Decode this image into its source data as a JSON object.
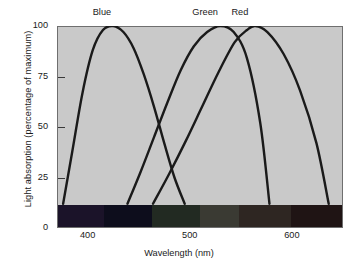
{
  "chart_data": {
    "type": "line",
    "title": "",
    "xlabel": "Wavelength (nm)",
    "ylabel": "Light absorption (percentage of maximum)",
    "xlim": [
      370,
      650
    ],
    "ylim": [
      0,
      100
    ],
    "grid": false,
    "legend_position": "inline-top-annotations",
    "x_ticks": [
      400,
      500,
      600
    ],
    "x_tick_labels": [
      "400",
      "500",
      "600"
    ],
    "y_ticks": [
      0,
      25,
      50,
      75,
      100
    ],
    "y_tick_labels": [
      "0",
      "25",
      "50",
      "75",
      "100"
    ],
    "annotations": [
      {
        "text": "Blue",
        "x": 414,
        "y": 100
      },
      {
        "text": "Green",
        "x": 515,
        "y": 100
      },
      {
        "text": "Red",
        "x": 549,
        "y": 100
      }
    ],
    "series": [
      {
        "name": "Blue",
        "color": "#1a1a1a",
        "peak_x": 425,
        "peak_y": 100,
        "x": [
          376,
          385,
          395,
          405,
          415,
          425,
          435,
          445,
          455,
          465,
          475,
          485,
          495
        ],
        "y": [
          12,
          38,
          67,
          88,
          98,
          100,
          97,
          89,
          76,
          60,
          42,
          25,
          12
        ]
      },
      {
        "name": "Green",
        "color": "#1a1a1a",
        "peak_x": 530,
        "peak_y": 100,
        "x": [
          439,
          452,
          465,
          478,
          491,
          504,
          517,
          530,
          543,
          556,
          569,
          578
        ],
        "y": [
          12,
          28,
          45,
          62,
          78,
          90,
          97,
          100,
          97,
          84,
          52,
          12
        ]
      },
      {
        "name": "Red",
        "color": "#1a1a1a",
        "peak_x": 564,
        "peak_y": 100,
        "x": [
          464,
          480,
          496,
          512,
          528,
          544,
          556,
          564,
          576,
          592,
          608,
          624,
          636
        ],
        "y": [
          12,
          27,
          43,
          60,
          77,
          92,
          98,
          100,
          97,
          86,
          68,
          42,
          12
        ]
      }
    ],
    "spectrum_band": {
      "description": "visible-light spectrum strip along the x-axis baseline",
      "segments": [
        {
          "name": "violet",
          "color": "#1b1329",
          "start_x": 370,
          "end_x": 415
        },
        {
          "name": "blue",
          "color": "#0d0d1c",
          "start_x": 415,
          "end_x": 463
        },
        {
          "name": "green",
          "color": "#222a22",
          "start_x": 463,
          "end_x": 510
        },
        {
          "name": "yellow",
          "color": "#3a3a33",
          "start_x": 510,
          "end_x": 548
        },
        {
          "name": "orange",
          "color": "#2e2622",
          "start_x": 548,
          "end_x": 600
        },
        {
          "name": "red",
          "color": "#1f1414",
          "start_x": 600,
          "end_x": 650
        }
      ]
    }
  },
  "figure": {
    "plot_background": "#c9c9c9",
    "page_background": "#ffffff",
    "line_color": "#1a1a1a"
  }
}
